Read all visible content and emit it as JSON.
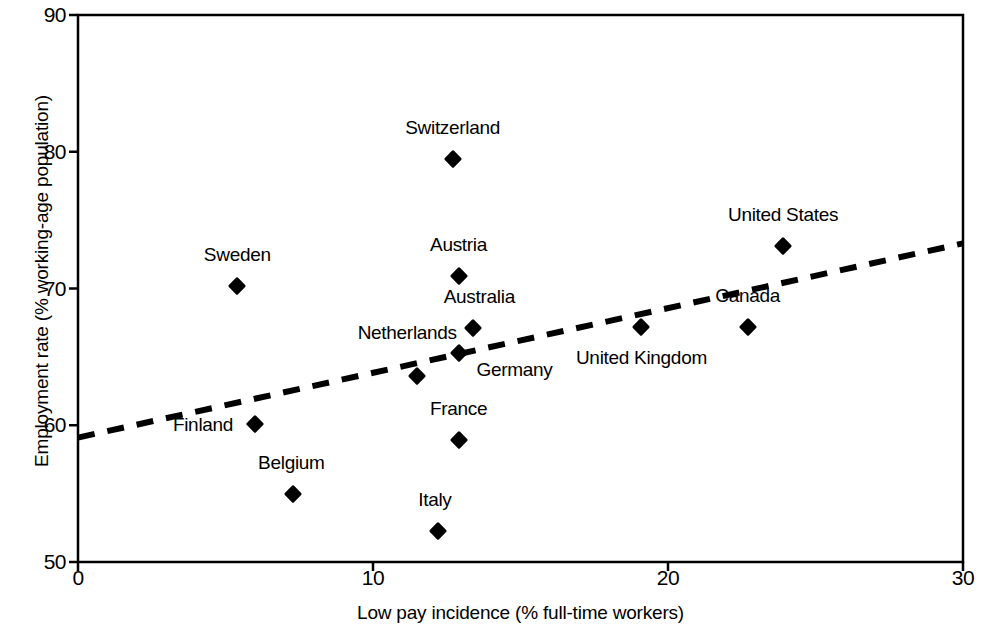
{
  "chart_data": {
    "type": "scatter",
    "title": "",
    "xlabel": "Low pay incidence (% full-time workers)",
    "ylabel": "Employment rate (% working-age population)",
    "xlim": [
      0,
      30
    ],
    "ylim": [
      50,
      90
    ],
    "xticks": [
      "0",
      "10",
      "20",
      "30"
    ],
    "xtick_values": [
      0,
      10,
      20,
      30
    ],
    "yticks": [
      "50",
      "60",
      "70",
      "80",
      "90"
    ],
    "ytick_values": [
      50,
      60,
      70,
      80,
      90
    ],
    "grid": false,
    "legend": "none",
    "marker_style": "filled-diamond",
    "marker_color": "#000000",
    "points": [
      {
        "label": "Sweden",
        "x": 5.4,
        "y": 70.2,
        "label_dx": 0,
        "label_dy": -20
      },
      {
        "label": "Finland",
        "x": 6.0,
        "y": 60.1,
        "label_dx": -52,
        "label_dy": 12
      },
      {
        "label": "Belgium",
        "x": 7.3,
        "y": 55.0,
        "label_dx": -2,
        "label_dy": -20
      },
      {
        "label": "Netherlands",
        "x": 11.5,
        "y": 63.6,
        "label_dx": -10,
        "label_dy": -32
      },
      {
        "label": "Italy",
        "x": 12.2,
        "y": 52.3,
        "label_dx": -3,
        "label_dy": -20
      },
      {
        "label": "Switzerland",
        "x": 12.7,
        "y": 79.5,
        "label_dx": 0,
        "label_dy": -20
      },
      {
        "label": "Austria",
        "x": 12.9,
        "y": 70.9,
        "label_dx": 0,
        "label_dy": -20
      },
      {
        "label": "France",
        "x": 12.9,
        "y": 58.9,
        "label_dx": 0,
        "label_dy": -20
      },
      {
        "label": "Germany",
        "x": 12.9,
        "y": 65.3,
        "label_dx": 56,
        "label_dy": 28
      },
      {
        "label": "Australia",
        "x": 13.4,
        "y": 67.1,
        "label_dx": 6,
        "label_dy": -20
      },
      {
        "label": "United Kingdom",
        "x": 19.1,
        "y": 67.2,
        "label_dx": 0,
        "label_dy": 42
      },
      {
        "label": "Canada",
        "x": 22.7,
        "y": 67.2,
        "label_dx": 0,
        "label_dy": -20
      },
      {
        "label": "United States",
        "x": 23.9,
        "y": 73.1,
        "label_dx": 0,
        "label_dy": -20
      }
    ],
    "trendline": {
      "style": "dashed",
      "color": "#000000",
      "x_start": 0,
      "y_start": 59.1,
      "x_end": 30,
      "y_end": 73.3
    }
  }
}
